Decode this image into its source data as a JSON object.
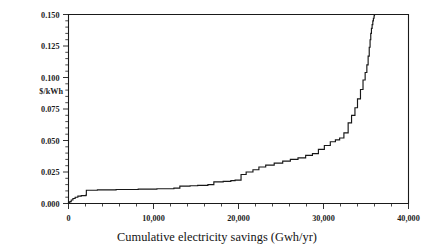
{
  "chart_data": {
    "type": "line",
    "subtype": "step-supply-curve",
    "title": "",
    "xlabel": "Cumulative electricity savings (Gwh/yr)",
    "ylabel": "$/kWh",
    "xlim": [
      0,
      40000
    ],
    "ylim": [
      0.0,
      0.15
    ],
    "grid": false,
    "legend": null,
    "x_ticks": [
      0,
      10000,
      20000,
      30000,
      40000
    ],
    "x_tick_labels": [
      "0",
      "10,000",
      "20,000",
      "30,000",
      "40,000"
    ],
    "x_minor_tick_interval": 2000,
    "y_ticks": [
      0.0,
      0.025,
      0.05,
      0.075,
      0.1,
      0.125,
      0.15
    ],
    "y_tick_labels": [
      "0.000",
      "0.025",
      "0.050",
      "0.075",
      "0.100",
      "0.125",
      "0.150"
    ],
    "y_minor_tick_interval": 0.005,
    "series": [
      {
        "name": "Conservation supply curve",
        "color": "#171717",
        "step_mode": "post",
        "x": [
          0,
          150,
          320,
          520,
          780,
          1100,
          1500,
          2050,
          2100,
          3400,
          5600,
          8200,
          10400,
          12400,
          13100,
          14300,
          15200,
          16400,
          17100,
          18200,
          19100,
          19600,
          20300,
          20900,
          21700,
          22400,
          23200,
          24200,
          25200,
          26100,
          27000,
          27900,
          28700,
          29400,
          30100,
          30800,
          31400,
          31900,
          32400,
          32900,
          33300,
          33700,
          34000,
          34350,
          34650,
          34900,
          35100,
          35250,
          35380,
          35480,
          35560,
          35640,
          35720,
          35800,
          35870,
          35950,
          36000
        ],
        "y": [
          0.0005,
          0.0015,
          0.0028,
          0.004,
          0.005,
          0.0058,
          0.0063,
          0.0066,
          0.0105,
          0.0108,
          0.0111,
          0.0114,
          0.0117,
          0.0122,
          0.0138,
          0.0141,
          0.0144,
          0.015,
          0.0172,
          0.0176,
          0.0182,
          0.0186,
          0.023,
          0.025,
          0.0268,
          0.029,
          0.0305,
          0.032,
          0.0336,
          0.035,
          0.0362,
          0.0382,
          0.0396,
          0.043,
          0.046,
          0.049,
          0.0505,
          0.052,
          0.056,
          0.064,
          0.07,
          0.076,
          0.083,
          0.0905,
          0.098,
          0.104,
          0.11,
          0.117,
          0.124,
          0.13,
          0.135,
          0.139,
          0.142,
          0.145,
          0.147,
          0.149,
          0.15
        ]
      }
    ],
    "annotations": []
  },
  "axes": {
    "y_axis_title": "$/kWh",
    "x_axis_title": "Cumulative electricity savings (Gwh/yr)"
  }
}
